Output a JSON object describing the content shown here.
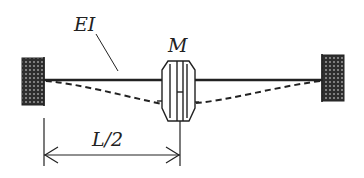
{
  "diagram": {
    "type": "mechanical-schematic",
    "colors": {
      "ink": "#222222",
      "wall_fill": "#3a3a3a",
      "background": "#ffffff"
    },
    "labels": {
      "stiffness": "EI",
      "mass": "M",
      "dimension": "L/2"
    },
    "elements": {
      "left_support": "fixed wall (hatched block)",
      "right_support": "fixed wall (hatched block)",
      "beam": "elastic shaft with flexural rigidity EI",
      "disk": "rotor disk of mass M at midspan",
      "deflection_curve": "dashed deflected shape",
      "dimension_line": "distance from left support to disk = L/2"
    }
  }
}
